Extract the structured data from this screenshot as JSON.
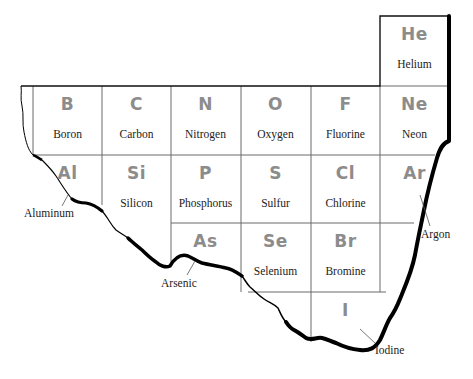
{
  "diagram": {
    "type": "periodic-table-fragment",
    "grid": {
      "columns_x": [
        33,
        102,
        171,
        241,
        311,
        380,
        449
      ],
      "rows_y": [
        16,
        86,
        155,
        223,
        292
      ]
    }
  },
  "elements": [
    {
      "symbol": "He",
      "name": "Helium",
      "col": 5,
      "row": 0,
      "label": "inside"
    },
    {
      "symbol": "B",
      "name": "Boron",
      "col": 0,
      "row": 1,
      "label": "inside"
    },
    {
      "symbol": "C",
      "name": "Carbon",
      "col": 1,
      "row": 1,
      "label": "inside"
    },
    {
      "symbol": "N",
      "name": "Nitrogen",
      "col": 2,
      "row": 1,
      "label": "inside"
    },
    {
      "symbol": "O",
      "name": "Oxygen",
      "col": 3,
      "row": 1,
      "label": "inside"
    },
    {
      "symbol": "F",
      "name": "Fluorine",
      "col": 4,
      "row": 1,
      "label": "inside"
    },
    {
      "symbol": "Ne",
      "name": "Neon",
      "col": 5,
      "row": 1,
      "label": "inside"
    },
    {
      "symbol": "Al",
      "name": "Aluminum",
      "col": 0,
      "row": 2,
      "label": "callout"
    },
    {
      "symbol": "Si",
      "name": "Silicon",
      "col": 1,
      "row": 2,
      "label": "inside"
    },
    {
      "symbol": "P",
      "name": "Phosphorus",
      "col": 2,
      "row": 2,
      "label": "inside"
    },
    {
      "symbol": "S",
      "name": "Sulfur",
      "col": 3,
      "row": 2,
      "label": "inside"
    },
    {
      "symbol": "Cl",
      "name": "Chlorine",
      "col": 4,
      "row": 2,
      "label": "inside"
    },
    {
      "symbol": "Ar",
      "name": "Argon",
      "col": 5,
      "row": 2,
      "label": "callout"
    },
    {
      "symbol": "As",
      "name": "Arsenic",
      "col": 2,
      "row": 3,
      "label": "callout"
    },
    {
      "symbol": "Se",
      "name": "Selenium",
      "col": 3,
      "row": 3,
      "label": "inside"
    },
    {
      "symbol": "Br",
      "name": "Bromine",
      "col": 4,
      "row": 3,
      "label": "inside"
    },
    {
      "symbol": "I",
      "name": "Iodine",
      "col": 4,
      "row": 4,
      "label": "callout"
    }
  ],
  "cells": {
    "He": {
      "sym": "He",
      "name": "Helium"
    },
    "B": {
      "sym": "B",
      "name": "Boron"
    },
    "C": {
      "sym": "C",
      "name": "Carbon"
    },
    "N": {
      "sym": "N",
      "name": "Nitrogen"
    },
    "O": {
      "sym": "O",
      "name": "Oxygen"
    },
    "F": {
      "sym": "F",
      "name": "Fluorine"
    },
    "Ne": {
      "sym": "Ne",
      "name": "Neon"
    },
    "Al": {
      "sym": "Al",
      "name": "Aluminum"
    },
    "Si": {
      "sym": "Si",
      "name": "Silicon"
    },
    "P": {
      "sym": "P",
      "name": "Phosphorus"
    },
    "S": {
      "sym": "S",
      "name": "Sulfur"
    },
    "Cl": {
      "sym": "Cl",
      "name": "Chlorine"
    },
    "Ar": {
      "sym": "Ar",
      "name": "Argon"
    },
    "As": {
      "sym": "As",
      "name": "Arsenic"
    },
    "Se": {
      "sym": "Se",
      "name": "Selenium"
    },
    "Br": {
      "sym": "Br",
      "name": "Bromine"
    },
    "I": {
      "sym": "I",
      "name": "Iodine"
    }
  },
  "colors": {
    "symbol": "#8c8c8c",
    "name_text": "#222222",
    "grid_line": "#555555",
    "torn_edge": "#000000",
    "background": "#ffffff"
  }
}
